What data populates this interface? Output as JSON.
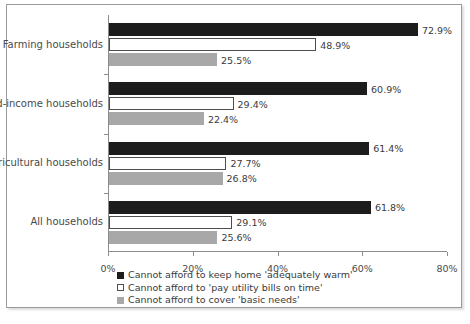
{
  "chart_data": {
    "type": "bar",
    "orientation": "horizontal",
    "title": "",
    "xlabel": "",
    "ylabel": "",
    "xlim": [
      0,
      80
    ],
    "xticks": [
      "0%",
      "20%",
      "40%",
      "60%",
      "80%"
    ],
    "xtick_values": [
      0,
      20,
      40,
      60,
      80
    ],
    "grid": false,
    "legend_position": "bottom",
    "categories": [
      "Farming households",
      "Mixed-income households",
      "Non-agricultural households",
      "All households"
    ],
    "series": [
      {
        "name": "Cannot afford to keep home 'adequately warm'",
        "color": "#1c1c1c",
        "values": [
          72.9,
          60.9,
          61.4,
          61.8
        ],
        "labels": [
          "72.9%",
          "60.9%",
          "61.4%",
          "61.8%"
        ]
      },
      {
        "name": "Cannot afford to 'pay utility bills on time'",
        "color": "#ffffff",
        "values": [
          48.9,
          29.4,
          27.7,
          29.1
        ],
        "labels": [
          "48.9%",
          "29.4%",
          "27.7%",
          "29.1%"
        ]
      },
      {
        "name": "Cannot afford to cover 'basic needs'",
        "color": "#a8a8a8",
        "values": [
          25.5,
          22.4,
          26.8,
          25.6
        ],
        "labels": [
          "25.5%",
          "22.4%",
          "26.8%",
          "25.6%"
        ]
      }
    ]
  }
}
